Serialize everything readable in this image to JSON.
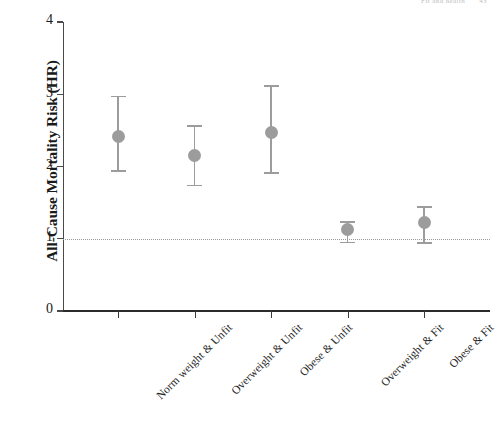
{
  "header": {
    "running_head": "Fit and health",
    "page_number": "43"
  },
  "chart_data": {
    "type": "scatter",
    "title": "",
    "subtitle": "",
    "xlabel": "",
    "ylabel": "All-Cause Mortality Risk (HR)",
    "categories": [
      "Norm weight & Unfit",
      "Overweight & Unfit",
      "Obese & Unfit",
      "Overweight & Fit",
      "Obese & Fit"
    ],
    "values": [
      2.42,
      2.15,
      2.47,
      1.13,
      1.22
    ],
    "ci_lower": [
      1.95,
      1.75,
      1.92,
      0.96,
      0.95
    ],
    "ci_upper": [
      2.98,
      2.57,
      3.13,
      1.24,
      1.45
    ],
    "ylim": [
      0,
      4
    ],
    "yticks": [
      "0",
      "1",
      "2",
      "3",
      "4"
    ],
    "ytick_values": [
      0,
      1,
      2,
      3,
      4
    ],
    "reference_line": 1,
    "reference_line_style": "dotted",
    "grid": false,
    "legend": "none",
    "marker_color": "#9c9c9c",
    "error_bar_color": "#9c9c9c",
    "reference_line_color": "#9a9a9a",
    "axis_color": "#3a3a3a"
  }
}
